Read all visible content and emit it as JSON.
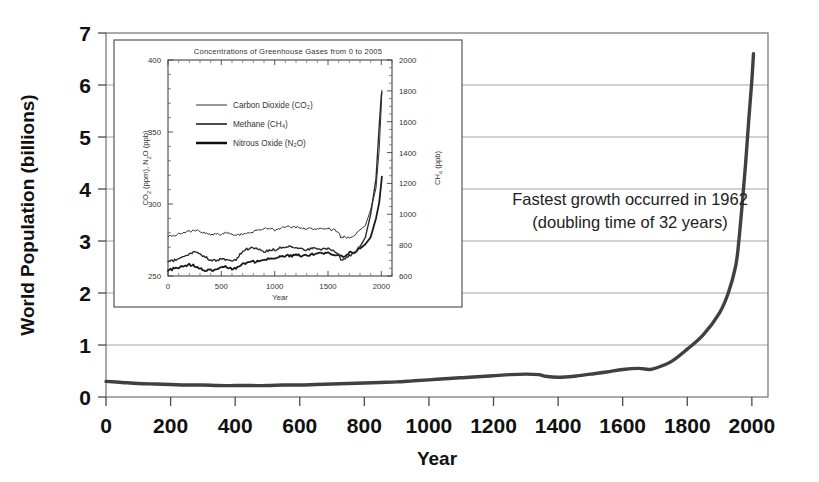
{
  "chart_data": [
    {
      "id": "main",
      "type": "line",
      "title": "",
      "xlabel": "Year",
      "ylabel": "World Population (billions)",
      "xlim": [
        0,
        2050
      ],
      "ylim": [
        0,
        7
      ],
      "grid": true,
      "legend_position": "none",
      "xticks": [
        "0",
        "200",
        "400",
        "600",
        "800",
        "1000",
        "1200",
        "1400",
        "1600",
        "1800",
        "2000"
      ],
      "xtick_values": [
        0,
        200,
        400,
        600,
        800,
        1000,
        1200,
        1400,
        1600,
        1800,
        2000
      ],
      "yticks": [
        "0",
        "1",
        "2",
        "3",
        "4",
        "5",
        "6",
        "7"
      ],
      "ytick_values": [
        0,
        1,
        2,
        3,
        4,
        5,
        6,
        7
      ],
      "series": [
        {
          "name": "World Population",
          "color": "#404040",
          "x": [
            0,
            50,
            100,
            150,
            200,
            250,
            300,
            350,
            400,
            450,
            500,
            550,
            600,
            650,
            700,
            750,
            800,
            850,
            900,
            950,
            1000,
            1050,
            1100,
            1150,
            1200,
            1250,
            1300,
            1340,
            1360,
            1400,
            1450,
            1500,
            1550,
            1600,
            1650,
            1680,
            1700,
            1750,
            1800,
            1850,
            1900,
            1927,
            1950,
            1960,
            1970,
            1980,
            1990,
            2000,
            2005
          ],
          "values": [
            0.3,
            0.28,
            0.26,
            0.25,
            0.24,
            0.23,
            0.23,
            0.22,
            0.22,
            0.22,
            0.22,
            0.23,
            0.23,
            0.24,
            0.25,
            0.26,
            0.27,
            0.28,
            0.29,
            0.31,
            0.33,
            0.35,
            0.37,
            0.39,
            0.41,
            0.43,
            0.44,
            0.43,
            0.4,
            0.38,
            0.4,
            0.44,
            0.48,
            0.53,
            0.55,
            0.53,
            0.55,
            0.68,
            0.92,
            1.2,
            1.62,
            2.0,
            2.52,
            3.02,
            3.7,
            4.44,
            5.29,
            6.09,
            6.6
          ]
        }
      ],
      "annotations": [
        {
          "id": "fastest-growth",
          "lines": [
            "Fastest growth occurred in 1962",
            "(doubling time of 32 years)"
          ]
        }
      ]
    },
    {
      "id": "inset",
      "type": "line",
      "title": "Concentrations of Greenhouse Gases from 0 to 2005",
      "xlabel": "Year",
      "ylabel_left": "CO2 (ppm), N2O (ppb)",
      "ylabel_right": "CH4 (ppb)",
      "xlim": [
        0,
        2100
      ],
      "ylim_left": [
        250,
        400
      ],
      "ylim_right": [
        600,
        2000
      ],
      "grid": false,
      "legend_position": "upper-left",
      "xticks": [
        "0",
        "500",
        "1000",
        "1500",
        "2000"
      ],
      "xtick_values": [
        0,
        500,
        1000,
        1500,
        2000
      ],
      "yticks_left": [
        "250",
        "300",
        "350",
        "400"
      ],
      "ytick_values_left": [
        250,
        300,
        350,
        400
      ],
      "yticks_right": [
        "600",
        "800",
        "1000",
        "1200",
        "1400",
        "1600",
        "1800",
        "2000"
      ],
      "ytick_values_right": [
        600,
        800,
        1000,
        1200,
        1400,
        1600,
        1800,
        2000
      ],
      "series": [
        {
          "name": "Carbon Dioxide (CO2)",
          "legend_label": "Carbon Dioxide (CO₂)",
          "axis": "left",
          "units": "ppm",
          "color": "#333333",
          "stroke_width": 1.0,
          "x": [
            0,
            50,
            100,
            150,
            200,
            250,
            300,
            350,
            400,
            450,
            500,
            550,
            600,
            650,
            700,
            750,
            800,
            850,
            900,
            950,
            1000,
            1050,
            1100,
            1150,
            1200,
            1250,
            1300,
            1350,
            1400,
            1450,
            1500,
            1550,
            1600,
            1620,
            1650,
            1700,
            1750,
            1800,
            1850,
            1900,
            1950,
            1980,
            2000,
            2005
          ],
          "values": [
            277,
            278,
            279,
            280,
            281,
            282,
            281,
            280,
            279,
            279,
            279,
            280,
            279,
            278,
            279,
            280,
            281,
            282,
            283,
            283,
            282,
            283,
            284,
            284,
            284,
            283,
            283,
            283,
            282,
            283,
            283,
            282,
            281,
            276,
            277,
            277,
            278,
            282,
            285,
            296,
            311,
            338,
            369,
            379
          ]
        },
        {
          "name": "Nitrous Oxide (N2O)",
          "legend_label": "Nitrous Oxide (N₂O)",
          "axis": "left",
          "units": "ppb",
          "color": "#1a1a1a",
          "stroke_width": 1.8,
          "x": [
            0,
            50,
            100,
            150,
            200,
            250,
            300,
            350,
            400,
            450,
            500,
            550,
            600,
            650,
            700,
            750,
            800,
            850,
            900,
            950,
            1000,
            1050,
            1100,
            1150,
            1200,
            1250,
            1300,
            1350,
            1400,
            1450,
            1500,
            1550,
            1600,
            1650,
            1700,
            1750,
            1800,
            1850,
            1900,
            1950,
            1980,
            2000,
            2005
          ],
          "values": [
            254,
            255,
            256,
            257,
            258,
            257,
            255,
            254,
            254,
            255,
            257,
            256,
            255,
            256,
            258,
            259,
            260,
            260,
            261,
            262,
            262,
            263,
            264,
            264,
            265,
            264,
            264,
            265,
            266,
            266,
            266,
            265,
            264,
            264,
            266,
            267,
            269,
            272,
            277,
            290,
            301,
            315,
            319
          ]
        },
        {
          "name": "Methane (CH4)",
          "legend_label": "Methane (CH₄)",
          "axis": "right",
          "units": "ppb",
          "color": "#2b2b2b",
          "stroke_width": 1.4,
          "x": [
            0,
            50,
            100,
            150,
            200,
            250,
            300,
            350,
            400,
            450,
            500,
            550,
            600,
            650,
            700,
            750,
            800,
            850,
            900,
            950,
            1000,
            1050,
            1100,
            1150,
            1200,
            1250,
            1300,
            1350,
            1400,
            1450,
            1500,
            1550,
            1600,
            1620,
            1650,
            1700,
            1750,
            1800,
            1850,
            1900,
            1950,
            1980,
            2000,
            2005
          ],
          "values": [
            690,
            700,
            715,
            730,
            745,
            760,
            745,
            720,
            705,
            700,
            715,
            700,
            690,
            715,
            760,
            775,
            780,
            770,
            760,
            765,
            770,
            780,
            790,
            790,
            785,
            775,
            770,
            780,
            775,
            770,
            775,
            770,
            745,
            700,
            715,
            730,
            750,
            790,
            850,
            1000,
            1230,
            1570,
            1775,
            1790
          ]
        }
      ]
    }
  ],
  "main_axis": {
    "ylabel": "World Population (billions)",
    "xlabel": "Year"
  },
  "annotation": {
    "line1": "Fastest growth occurred in 1962",
    "line2": "(doubling time of 32 years)"
  },
  "inset": {
    "title": "Concentrations of Greenhouse Gases from 0 to 2005",
    "xlabel": "Year",
    "ylabel_left_pre": "CO",
    "ylabel_left_sub": "2",
    "ylabel_left_mid": " (ppm), N",
    "ylabel_left_sub2": "2",
    "ylabel_left_post": "O (ppb)",
    "ylabel_right_pre": "CH",
    "ylabel_right_sub": "4",
    "ylabel_right_post": " (ppb)",
    "legend": {
      "co2": "Carbon Dioxide (CO₂)",
      "ch4": "Methane (CH₄)",
      "n2o": "Nitrous Oxide (N₂O)"
    }
  },
  "colors": {
    "curve": "#404040",
    "grid": "#999999",
    "frame": "#666666",
    "text": "#111111",
    "background": "#ffffff"
  }
}
